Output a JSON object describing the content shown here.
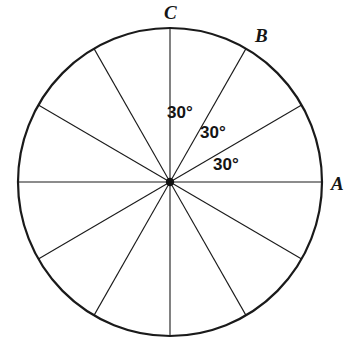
{
  "figure": {
    "background_color": "#ffffff",
    "stroke_color": "#1a1a1a",
    "circle": {
      "center_x": 170,
      "center_y": 182,
      "radius_x": 152,
      "radius_y": 154,
      "stroke_width": 2.2
    },
    "center_dot": {
      "radius": 4.2,
      "color": "#111111"
    },
    "spokes": {
      "count": 12,
      "step_degrees": 30,
      "stroke_width": 1.1,
      "angles_degrees": [
        0,
        30,
        60,
        90,
        120,
        150,
        180,
        210,
        240,
        270,
        300,
        330
      ]
    },
    "point_labels": [
      {
        "id": "A",
        "text": "A",
        "angle_degrees": 0
      },
      {
        "id": "B",
        "text": "B",
        "angle_degrees": 60
      },
      {
        "id": "C",
        "text": "C",
        "angle_degrees": 90
      }
    ],
    "angle_labels": [
      {
        "text": "30°",
        "between": "OC and OB"
      },
      {
        "text": "30°",
        "between": "OB and unlabeled 30° spoke"
      },
      {
        "text": "30°",
        "between": "30° spoke and OA"
      }
    ]
  },
  "chart_data": {
    "type": "pie",
    "categories": [
      "S1",
      "S2",
      "S3",
      "S4",
      "S5",
      "S6",
      "S7",
      "S8",
      "S9",
      "S10",
      "S11",
      "S12"
    ],
    "values": [
      30,
      30,
      30,
      30,
      30,
      30,
      30,
      30,
      30,
      30,
      30,
      30
    ],
    "unit": "degrees",
    "total": 360,
    "labels_shown": [
      "30°",
      "30°",
      "30°"
    ],
    "annotations": [
      "A",
      "B",
      "C"
    ],
    "xlabel": "",
    "ylabel": "",
    "legend": "none",
    "grid": false
  }
}
